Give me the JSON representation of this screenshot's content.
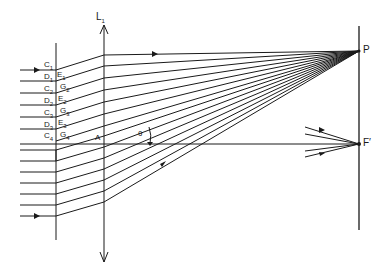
{
  "diagram": {
    "type": "optics-echelon-grating",
    "labels": {
      "lens": "L",
      "lens_sub": "1",
      "point_p": "P",
      "focus": "F′",
      "axis_point": "A",
      "angle": "θ"
    },
    "step_labels": [
      {
        "letter": "C",
        "sub": "1"
      },
      {
        "letter": "D",
        "sub": "1"
      },
      {
        "letter": "E",
        "sub": "1"
      },
      {
        "letter": "C",
        "sub": "2"
      },
      {
        "letter": "G",
        "sub": "2"
      },
      {
        "letter": "D",
        "sub": "2"
      },
      {
        "letter": "E",
        "sub": "2"
      },
      {
        "letter": "C",
        "sub": "3"
      },
      {
        "letter": "G",
        "sub": "3"
      },
      {
        "letter": "D",
        "sub": "3"
      },
      {
        "letter": "E",
        "sub": "3"
      },
      {
        "letter": "C",
        "sub": "4"
      },
      {
        "letter": "G",
        "sub": "4"
      }
    ]
  }
}
